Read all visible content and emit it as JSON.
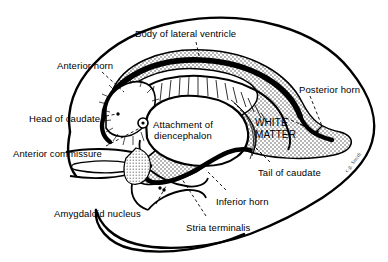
{
  "figure": {
    "type": "anatomical-diagram",
    "signature": "c.g. Smith"
  },
  "colors": {
    "ink": "#000000",
    "background": "#ffffff",
    "stipple": "#9a9a9a"
  },
  "labels": [
    {
      "id": "body-of-lateral-ventricle",
      "text": "Body of lateral ventricle",
      "x": 135,
      "y": 28
    },
    {
      "id": "anterior-horn",
      "text": "Anterior horn",
      "x": 57,
      "y": 60
    },
    {
      "id": "posterior-horn",
      "text": "Posterior horn",
      "x": 299,
      "y": 84
    },
    {
      "id": "head-of-caudate",
      "text": "Head of caudate",
      "x": 29,
      "y": 113
    },
    {
      "id": "anterior-commissure",
      "text": "Anterior commissure",
      "x": 13,
      "y": 148
    },
    {
      "id": "tail-of-caudate",
      "text": "Tail of caudate",
      "x": 258,
      "y": 167
    },
    {
      "id": "inferior-horn",
      "text": "Inferior horn",
      "x": 216,
      "y": 196
    },
    {
      "id": "stria-terminalis",
      "text": "Stria terminalis",
      "x": 186,
      "y": 222
    },
    {
      "id": "amygdaloid-nucleus",
      "text": "Amygdaloid nucleus",
      "x": 54,
      "y": 208
    }
  ],
  "multiline_labels": [
    {
      "id": "attachment-of-diencephalon",
      "lines": [
        "Attachment of",
        "diencephalon"
      ],
      "x": 153,
      "y": 119
    },
    {
      "id": "white-matter",
      "lines": [
        "WHITE",
        "MATTER"
      ],
      "x": 255,
      "y": 117
    }
  ]
}
